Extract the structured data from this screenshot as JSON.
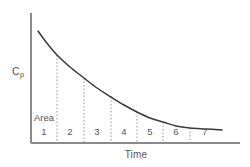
{
  "figure": {
    "background_color": "#ffffff",
    "width": 250,
    "height": 167
  },
  "labels": {
    "y_axis": "Cp",
    "y_axis_base": "C",
    "y_axis_sub": "p",
    "x_axis": "Time",
    "area": "Area"
  },
  "colors": {
    "axis": "#8a8a8a",
    "curve": "#3a3a3a",
    "divider": "#9a9a9a",
    "text": "#555555",
    "background": "#ffffff"
  },
  "chart_data": {
    "type": "line",
    "title": "",
    "subtitle": "",
    "xlabel": "Time",
    "ylabel": "Cp",
    "grid": false,
    "legend": null,
    "annotations": [
      "Area"
    ],
    "axis_arrows": false,
    "tick_labels_x": [
      "1",
      "2",
      "3",
      "4",
      "5",
      "6",
      "7"
    ],
    "tick_labels_y": [],
    "xlim": [
      0,
      7.6
    ],
    "ylim": [
      0,
      1.0
    ],
    "segments": [
      {
        "index": 1,
        "label": "1",
        "x_center_px": 44
      },
      {
        "index": 2,
        "label": "2",
        "x_center_px": 70
      },
      {
        "index": 3,
        "label": "3",
        "x_center_px": 97
      },
      {
        "index": 4,
        "label": "4",
        "x_center_px": 124
      },
      {
        "index": 5,
        "label": "5",
        "x_center_px": 150
      },
      {
        "index": 6,
        "label": "6",
        "x_center_px": 176
      },
      {
        "index": 7,
        "label": "7",
        "x_center_px": 205
      }
    ],
    "divider_x_px": [
      57,
      84,
      111,
      137,
      163,
      190
    ],
    "series": [
      {
        "name": "plasma concentration decay",
        "description": "monoexponential decline of drug plasma concentration over time",
        "x": [
          0,
          0.5,
          1,
          1.5,
          2,
          2.5,
          3,
          3.5,
          4,
          4.5,
          5,
          5.5,
          6,
          6.5,
          7
        ],
        "values": [
          1.0,
          0.87,
          0.76,
          0.66,
          0.58,
          0.5,
          0.44,
          0.38,
          0.33,
          0.29,
          0.25,
          0.22,
          0.19,
          0.17,
          0.15
        ]
      }
    ],
    "curve_points_px": [
      [
        38,
        31
      ],
      [
        46,
        42
      ],
      [
        57,
        55
      ],
      [
        70,
        67
      ],
      [
        84,
        78
      ],
      [
        97,
        88
      ],
      [
        111,
        97
      ],
      [
        124,
        105
      ],
      [
        137,
        112
      ],
      [
        150,
        118
      ],
      [
        163,
        122
      ],
      [
        176,
        126
      ],
      [
        190,
        128
      ],
      [
        206,
        129
      ],
      [
        222,
        130
      ]
    ],
    "axes_px": {
      "origin_x": 31,
      "origin_y": 143,
      "y_top": 13,
      "x_right": 240
    }
  }
}
